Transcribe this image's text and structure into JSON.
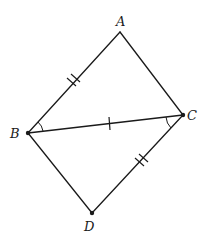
{
  "diagram": {
    "type": "geometry",
    "colors": {
      "stroke": "#1a1a1a",
      "background": "#ffffff"
    },
    "points": {
      "A": {
        "label": "A",
        "x": 120,
        "y": 32
      },
      "B": {
        "label": "B",
        "x": 28,
        "y": 133
      },
      "C": {
        "label": "C",
        "x": 183,
        "y": 115
      },
      "D": {
        "label": "D",
        "x": 92,
        "y": 213
      }
    },
    "segments": [
      {
        "from": "A",
        "to": "B",
        "ticks": 2
      },
      {
        "from": "A",
        "to": "C",
        "ticks": 0
      },
      {
        "from": "B",
        "to": "C",
        "ticks": 1
      },
      {
        "from": "B",
        "to": "D",
        "ticks": 0
      },
      {
        "from": "C",
        "to": "D",
        "ticks": 2
      }
    ],
    "angle_marks": [
      {
        "vertex": "B",
        "between": [
          "A",
          "C"
        ],
        "arcs": 1
      },
      {
        "vertex": "C",
        "between": [
          "B",
          "D"
        ],
        "arcs": 1
      }
    ],
    "dots": [
      "B",
      "C",
      "D"
    ]
  }
}
